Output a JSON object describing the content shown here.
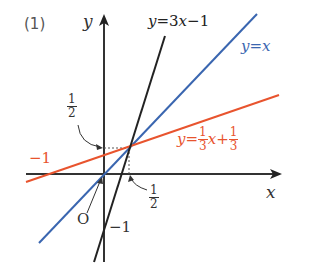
{
  "problem_label": "(1)",
  "axes": {
    "x_label": "x",
    "y_label": "y",
    "origin_label": "O"
  },
  "lines": [
    {
      "name": "y=3x-1",
      "label_y": "y",
      "label_eq": "=3",
      "label_x": "x",
      "label_rest": "−1",
      "color": "#222222"
    },
    {
      "name": "y=x",
      "label": "y=x",
      "color": "#3a66b0"
    },
    {
      "name": "y=1/3x+1/3",
      "label_pre": "y=",
      "frac1_num": "1",
      "frac1_den": "3",
      "label_mid": "x+",
      "frac2_num": "1",
      "frac2_den": "3",
      "color": "#e8542e"
    }
  ],
  "annotations": {
    "y_intercept_half_num": "1",
    "y_intercept_half_den": "2",
    "x_half_num": "1",
    "x_half_den": "2",
    "red_x_intercept": "−1",
    "black_y_intercept": "−1"
  },
  "colors": {
    "axis": "#333333",
    "black_line": "#222222",
    "blue_line": "#3a66b0",
    "red_line": "#e8542e",
    "dashed": "#555555"
  },
  "intersection_point": {
    "x": "1/2",
    "y": "1/2"
  }
}
